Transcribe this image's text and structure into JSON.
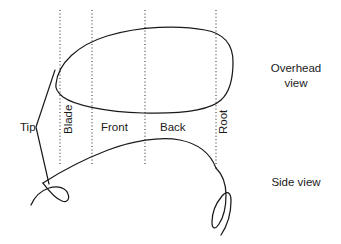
{
  "figure": {
    "background_color": "#ffffff",
    "line_color": "#1a1a1a",
    "guide_color": "#333333"
  },
  "region_labels": [
    {
      "id": "tip",
      "text": "Tip",
      "orientation": "horizontal",
      "x": 20,
      "y": 131
    },
    {
      "id": "blade",
      "text": "Blade",
      "orientation": "vertical",
      "x": 72,
      "y": 134
    },
    {
      "id": "front",
      "text": "Front",
      "orientation": "horizontal",
      "x": 101,
      "y": 131
    },
    {
      "id": "back",
      "text": "Back",
      "orientation": "horizontal",
      "x": 160,
      "y": 131
    },
    {
      "id": "root",
      "text": "Root",
      "orientation": "vertical",
      "x": 227,
      "y": 134
    }
  ],
  "view_labels": [
    {
      "id": "overhead-view",
      "lines": [
        "Overhead",
        "view"
      ],
      "line1": "Overhead",
      "line2": "view",
      "x": 296,
      "y": 72
    },
    {
      "id": "side-view",
      "lines": [
        "Side view"
      ],
      "line1": "Side view",
      "line2": "",
      "x": 296,
      "y": 186
    }
  ],
  "guide_lines": [
    {
      "id": "guide-tip-blade",
      "x": 60,
      "y1": 10,
      "y2": 166
    },
    {
      "id": "guide-blade-front",
      "x": 92,
      "y1": 10,
      "y2": 166
    },
    {
      "id": "guide-front-back",
      "x": 145,
      "y1": 10,
      "y2": 166
    },
    {
      "id": "guide-back-root",
      "x": 216,
      "y1": 10,
      "y2": 166
    }
  ],
  "shapes": {
    "overhead_outline": "M 56 84 C 58 63 78 45 107 36 C 140 26 180 25 205 30 C 228 34 233 48 233 62 C 233 78 230 92 221 100 C 210 110 180 114 143 113 C 105 112 74 105 63 97 C 57 92 55 88 56 84 Z",
    "side_arc": "M 43 183 C 60 172 82 160 108 150 C 132 141 160 136 180 140 C 200 144 211 155 216 168",
    "tip_hook": "M 43 183 C 49 191 57 199 62 201 C 67 203 70 199 68 194 C 66 188 58 185 49 188 C 40 191 34 198 31 205",
    "root_loop": "M 216 168 C 222 174 226 183 226 195 C 226 208 223 218 219 224 C 215 230 212 229 212 222 C 212 212 217 202 222 196 C 227 190 231 192 231 201 C 231 213 227 226 221 235",
    "tip_bracket": "M 55 70 L 36 127 L 49 184"
  }
}
